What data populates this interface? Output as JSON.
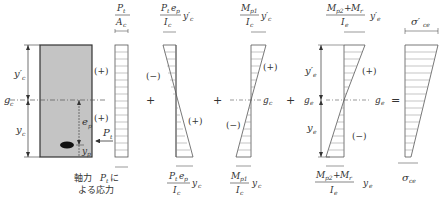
{
  "diagram": {
    "section": {
      "labels": {
        "yc_prime": "y′c",
        "gc": "gc",
        "yc": "yc",
        "ep": "ep",
        "yp": "yp",
        "Pt": "Pt"
      },
      "fill": "#c4c4c4"
    },
    "stress_blocks": [
      {
        "id": "axial",
        "top_label": "Pt / Ac",
        "signs": [
          "(+)",
          "(+)"
        ],
        "caption": [
          "軸力 Ptに",
          "よる応力"
        ]
      },
      {
        "id": "prestress-bending",
        "top_label": "Pt ep / Ic · y′c",
        "bottom_label": "Pt ep / Ic · yc",
        "signs": [
          "(−)",
          "(+)"
        ]
      },
      {
        "id": "self-weight-moment",
        "top_label": "Mp1 / Ic · y′c",
        "bottom_label": "Mp1 / Ic · yc",
        "signs": [
          "(+)",
          "(−)"
        ],
        "axis_label": "gc"
      },
      {
        "id": "additional-moment",
        "top_label": "Mp2+Mr / Ie · y′e",
        "bottom_label": "Mp2+Mr / Ie · ye",
        "signs": [
          "(+)",
          "(−)"
        ],
        "axis_label": "ge",
        "side_labels": [
          "y′e",
          "ge",
          "ye"
        ]
      },
      {
        "id": "resultant",
        "top_label": "σ′ce",
        "bottom_label": "σce"
      }
    ],
    "operators": [
      "+",
      "+",
      "+",
      "="
    ]
  }
}
